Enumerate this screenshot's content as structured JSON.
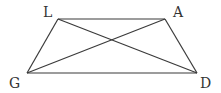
{
  "diagram": {
    "type": "trapezoid-with-diagonals",
    "stroke_color": "#3a3a3a",
    "vertices": [
      {
        "name": "L",
        "x": 58,
        "y": 19,
        "label_x": 43,
        "label_y": 17
      },
      {
        "name": "A",
        "x": 165,
        "y": 19,
        "label_x": 173,
        "label_y": 17
      },
      {
        "name": "D",
        "x": 197,
        "y": 73,
        "label_x": 200,
        "label_y": 88
      },
      {
        "name": "G",
        "x": 27,
        "y": 73,
        "label_x": 9,
        "label_y": 88
      }
    ],
    "edges": [
      [
        "L",
        "A"
      ],
      [
        "A",
        "D"
      ],
      [
        "D",
        "G"
      ],
      [
        "G",
        "L"
      ]
    ],
    "diagonals": [
      [
        "L",
        "D"
      ],
      [
        "A",
        "G"
      ]
    ],
    "labels": {
      "L": "L",
      "A": "A",
      "D": "D",
      "G": "G"
    }
  }
}
